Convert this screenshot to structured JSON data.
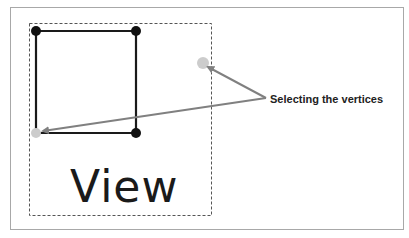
{
  "diagram": {
    "annotation_label": "Selecting the vertices",
    "view_label": "View",
    "colors": {
      "frame_border": "#a8a8a8",
      "dashed_box": "#555555",
      "square_edge": "#1a1a1a",
      "vertex_fill": "#111111",
      "selected_vertex_fill": "#cccccc",
      "arrow": "#808080",
      "text": "#222222"
    },
    "square": {
      "vertices": [
        {
          "x": 36,
          "y": 31,
          "selected": false
        },
        {
          "x": 136,
          "y": 31,
          "selected": false
        },
        {
          "x": 136,
          "y": 133,
          "selected": false
        },
        {
          "x": 36,
          "y": 133,
          "selected": true
        }
      ]
    },
    "floating_selected_vertex": {
      "x": 203,
      "y": 63
    },
    "arrows": [
      {
        "from": [
          266,
          98
        ],
        "to": [
          207,
          67
        ]
      },
      {
        "from": [
          266,
          98
        ],
        "to": [
          42,
          131
        ]
      }
    ]
  }
}
